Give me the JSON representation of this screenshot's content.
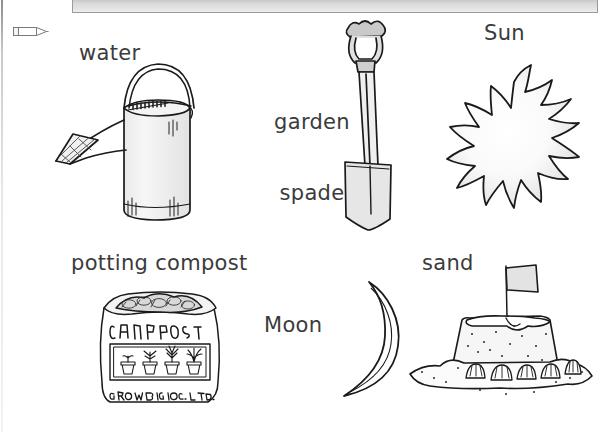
{
  "toolbar": {
    "name": "empty-toolbar",
    "background_color": "#dcdcdc",
    "border_color": "#9a9a9a"
  },
  "icons": {
    "pencil": {
      "name": "pencil-icon",
      "label": "pencil",
      "direction": "right"
    }
  },
  "worksheet": {
    "background_color": "#ffffff",
    "text_color": "#3b3b3b",
    "line_art_color": "#1a1a1a",
    "items": [
      {
        "id": "water",
        "label": "water",
        "illustration": "watering-can",
        "label_lines": [
          "water"
        ]
      },
      {
        "id": "garden-spade",
        "label": "garden spade",
        "illustration": "garden-spade",
        "label_lines": [
          "garden",
          "spade"
        ]
      },
      {
        "id": "sun",
        "label": "Sun",
        "illustration": "sun",
        "label_lines": [
          "Sun"
        ]
      },
      {
        "id": "potting-compost",
        "label": "potting compost",
        "illustration": "compost-bag",
        "label_lines": [
          "potting compost"
        ]
      },
      {
        "id": "moon",
        "label": "Moon",
        "illustration": "crescent-moon",
        "label_lines": [
          "Moon"
        ]
      },
      {
        "id": "sand",
        "label": "sand",
        "illustration": "sandcastle",
        "label_lines": [
          "sand"
        ]
      }
    ]
  },
  "illustration_text": {
    "compost_bag_front": "COMPOST",
    "compost_bag_brand": "GROWBIG CO. LTD.",
    "compost_bag_pot_count": 4,
    "sandcastle_shell_count": 5
  }
}
